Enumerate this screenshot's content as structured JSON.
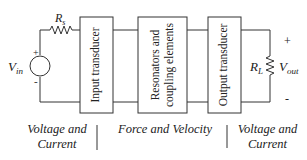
{
  "blocks": {
    "input": "Input transducer",
    "resonator_line1": "Resonators and",
    "resonator_line2": "coupling elements",
    "output": "Output transducer"
  },
  "source": {
    "voltage_label": "V",
    "voltage_sub": "in",
    "resistor_label": "R",
    "resistor_sub": "s",
    "plus": "+",
    "minus": "-"
  },
  "load": {
    "resistor_label": "R",
    "resistor_sub": "L",
    "voltage_label": "V",
    "voltage_sub": "out",
    "plus": "+",
    "minus": "-"
  },
  "domains": {
    "left_line1": "Voltage and",
    "left_line2": "Current",
    "middle": "Force and Velocity",
    "right_line1": "Voltage and",
    "right_line2": "Current"
  }
}
